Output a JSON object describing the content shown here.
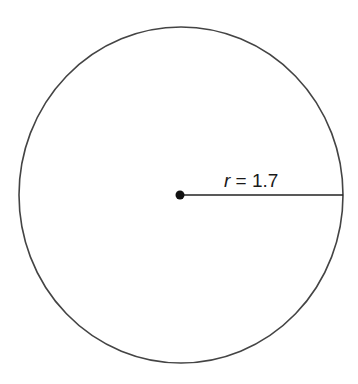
{
  "diagram": {
    "shape": "circle",
    "radius_label": {
      "variable": "r",
      "equals": " = ",
      "value": "1.7"
    },
    "colors": {
      "stroke": "#444444",
      "center_dot": "#111111",
      "radius_line": "#222222",
      "background": "#ffffff"
    }
  }
}
